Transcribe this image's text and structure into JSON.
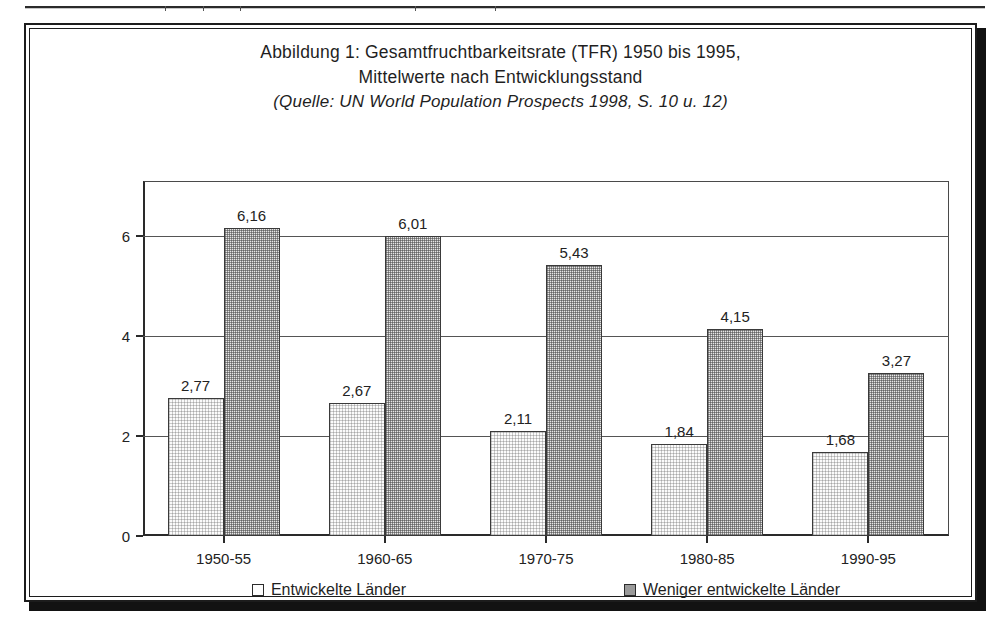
{
  "figure": {
    "title_lines": [
      "Abbildung 1: Gesamtfruchtbarkeitsrate (TFR) 1950 bis 1995,",
      "Mittelwerte nach Entwicklungsstand",
      "(Quelle: UN World Population Prospects 1998, S. 10 u. 12)"
    ]
  },
  "chart_data": {
    "type": "bar",
    "title": "Abbildung 1: Gesamtfruchtbarkeitsrate (TFR) 1950 bis 1995, Mittelwerte nach Entwicklungsstand",
    "subtitle": "(Quelle: UN World Population Prospects 1998, S. 10 u. 12)",
    "xlabel": "",
    "ylabel": "",
    "categories": [
      "1950-55",
      "1960-65",
      "1970-75",
      "1980-85",
      "1990-95"
    ],
    "series": [
      {
        "name": "Entwickelte Länder",
        "values": [
          2.77,
          2.67,
          2.11,
          1.84,
          1.68
        ],
        "labels": [
          "2,77",
          "2,67",
          "2,11",
          "1,84",
          "1,68"
        ],
        "color": "#fbfbfb",
        "pattern": "fine-dither"
      },
      {
        "name": "Weniger entwickelte Länder",
        "values": [
          6.16,
          6.01,
          5.43,
          4.15,
          3.27
        ],
        "labels": [
          "6,16",
          "6,01",
          "5,43",
          "4,15",
          "3,27"
        ],
        "color": "#c8c8c8",
        "pattern": "dense-dither"
      }
    ],
    "ylim": [
      0,
      7.1
    ],
    "yticks": [
      0,
      2,
      4,
      6
    ],
    "ytick_labels": [
      "0",
      "2",
      "4",
      "6"
    ],
    "grid": true,
    "grid_axis": "y",
    "legend_position": "bottom"
  }
}
